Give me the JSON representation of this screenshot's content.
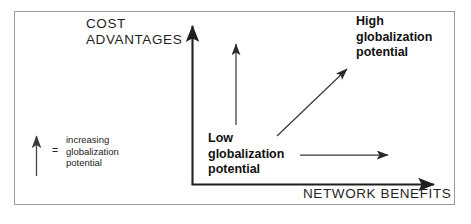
{
  "figure": {
    "type": "conceptual-2x2-arrow-diagram",
    "background_color": "#ffffff",
    "border_color": "#9a9a9a",
    "line_color": "#1f1f1f"
  },
  "axes": {
    "y_axis_label": "COST ADVANTAGES",
    "y_axis_label_line1": "COST",
    "y_axis_label_line2": "ADVANTAGES",
    "x_axis_label": "NETWORK BENEFITS"
  },
  "callouts": {
    "low": {
      "line1": "Low",
      "line2": "globalization",
      "line3": "potential"
    },
    "high": {
      "line1": "High",
      "line2": "globalization",
      "line3": "potential"
    }
  },
  "legend": {
    "equals_symbol": "=",
    "line1": "increasing",
    "line2": "globalization",
    "line3": "potential",
    "arrow_name": "increasing-arrow"
  },
  "arrows": {
    "y_axis": "vertical-axis-arrow",
    "x_axis": "horizontal-axis-arrow",
    "vertical_inner": "cost-advantage-increase-arrow",
    "horizontal_inner": "network-benefit-increase-arrow",
    "diagonal": "high-globalization-diagonal-arrow"
  }
}
